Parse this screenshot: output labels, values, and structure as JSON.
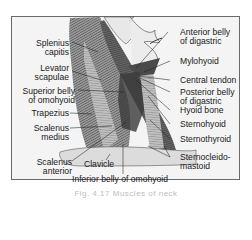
{
  "figure": {
    "caption": "Fig. 4.17 Muscles of neck",
    "colors": {
      "frame_bg": "#f4f4f4",
      "border": "#6a6a6a",
      "muscle_dark": "#3a3a3a",
      "muscle_mid": "#8a8a8a",
      "muscle_light": "#c8c8c8",
      "text": "#1a1a1a"
    }
  },
  "labels_left": [
    {
      "id": "splenius-capitis",
      "lines": [
        "Splenius",
        "capitis"
      ]
    },
    {
      "id": "levator-scapulae",
      "lines": [
        "Levator",
        "scapulae"
      ]
    },
    {
      "id": "superior-belly-omohyoid",
      "lines": [
        "Superior belly",
        "of omohyoid"
      ]
    },
    {
      "id": "trapezius",
      "lines": [
        "Trapezius"
      ]
    },
    {
      "id": "scalenus-medius",
      "lines": [
        "Scalenus",
        "medius"
      ]
    },
    {
      "id": "scalenus-anterior",
      "lines": [
        "Scalenus",
        "anterior"
      ]
    }
  ],
  "labels_right": [
    {
      "id": "anterior-belly-digastric",
      "lines": [
        "Anterior belly",
        "of digastric"
      ]
    },
    {
      "id": "mylohyoid",
      "lines": [
        "Mylohyoid"
      ]
    },
    {
      "id": "central-tendon",
      "lines": [
        "Central tendon"
      ]
    },
    {
      "id": "posterior-belly-digastric",
      "lines": [
        "Posterior belly",
        "of digastric"
      ]
    },
    {
      "id": "hyoid-bone",
      "lines": [
        "Hyoid bone"
      ]
    },
    {
      "id": "sternohyoid",
      "lines": [
        "Sternohyoid"
      ]
    },
    {
      "id": "sternothyroid",
      "lines": [
        "Sternothyroid"
      ]
    },
    {
      "id": "sternocleidomastoid",
      "lines": [
        "Sternocleido-",
        "mastoid"
      ]
    }
  ],
  "labels_bottom": [
    {
      "id": "clavicle",
      "lines": [
        "Clavicle"
      ]
    },
    {
      "id": "inferior-belly-omohyoid",
      "lines": [
        "Inferior belly of omohyoid"
      ]
    }
  ]
}
